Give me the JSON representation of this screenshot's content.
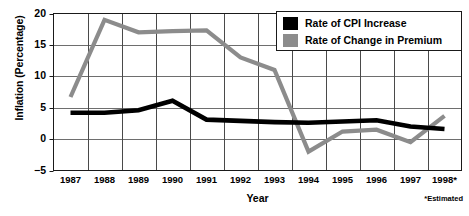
{
  "chart_data": {
    "type": "line",
    "title": "",
    "xlabel": "Year",
    "ylabel": "Inflation (Percentage)",
    "footnote": "*Estimated",
    "categories": [
      "1987",
      "1988",
      "1989",
      "1990",
      "1991",
      "1992",
      "1993",
      "1994",
      "1995",
      "1996",
      "1997",
      "1998*"
    ],
    "ylim": [
      -5,
      20
    ],
    "yticks": [
      20,
      15,
      10,
      5,
      0,
      -5
    ],
    "ytick_labels": [
      "20",
      "15",
      "10",
      "5",
      "0",
      "−5"
    ],
    "grid": true,
    "legend_position": "top-right",
    "series": [
      {
        "name": "Rate of CPI Increase",
        "color": "#000000",
        "values": [
          4.2,
          4.2,
          4.6,
          6.1,
          3.1,
          2.9,
          2.7,
          2.6,
          2.8,
          3.0,
          2.0,
          1.6
        ]
      },
      {
        "name": "Rate of Change in Premium",
        "color": "#8c8c8c",
        "values": [
          6.7,
          19.0,
          17.0,
          17.2,
          17.3,
          13.0,
          11.0,
          -2.0,
          1.2,
          1.5,
          -0.5,
          3.7
        ]
      }
    ]
  },
  "legend": {
    "items": [
      {
        "label": "Rate of CPI Increase",
        "color": "#000000"
      },
      {
        "label": "Rate of Change in Premium",
        "color": "#8c8c8c"
      }
    ]
  },
  "axes": {
    "y_title": "Inflation (Percentage)",
    "x_title": "Year",
    "footnote": "*Estimated"
  }
}
